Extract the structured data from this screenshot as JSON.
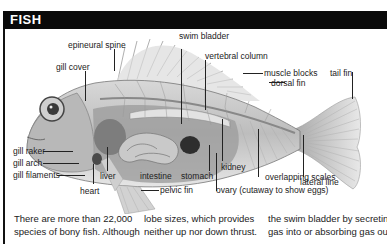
{
  "header": {
    "title": "FISH"
  },
  "figure": {
    "labels": {
      "swim_bladder": "swim bladder",
      "epineural_spine": "epineural spine",
      "vertebral_column": "vertebral column",
      "gill_cover": "gill cover",
      "muscle_blocks": "muscle blocks",
      "tail_fin": "tail fin",
      "dorsal_fin": "dorsal fin",
      "gill_raker": "gill raker",
      "gill_arch": "gill arch",
      "lateral_line": "lateral line",
      "gill_filaments": "gill filaments",
      "liver": "liver",
      "intestine": "intestine",
      "stomach": "stomach",
      "kidney": "kidney",
      "overlapping_scales": "overlapping scales",
      "heart": "heart",
      "pelvic_fin": "pelvic fin",
      "ovary": "ovary (cutaway to show eggs)"
    }
  },
  "body": {
    "columns": [
      {
        "lines": [
          "There are more than 22,000",
          "species of bony fish. Although"
        ]
      },
      {
        "lines": [
          "lobe sizes, which provides",
          "neither up nor down thrust."
        ]
      },
      {
        "lines": [
          "the swim bladder by secreting",
          "gas into or absorbing gas out"
        ]
      }
    ]
  }
}
